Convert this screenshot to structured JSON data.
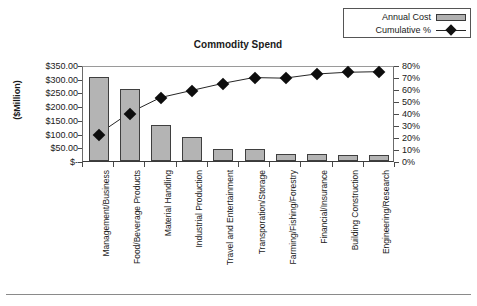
{
  "chart_data": {
    "type": "bar",
    "title": "Commodity Spend",
    "xlabel": "",
    "ylabel": "($Million)",
    "grid": false,
    "legend_position": "top-right",
    "categories": [
      "Management/Business",
      "Food/Beverage Products",
      "Material Handling",
      "Industrial Production",
      "Travel and Entertainment",
      "Transporation/Storage",
      "Farming/Fishing/Forestry",
      "Financial/Insurance",
      "Building Construction",
      "Engineering/Research"
    ],
    "series": [
      {
        "name": "Annual Cost",
        "type": "bar",
        "axis": "left",
        "values": [
          307.0,
          264.0,
          131.0,
          88.0,
          45.0,
          45.0,
          24.0,
          24.0,
          22.0,
          23.0
        ]
      },
      {
        "name": "Cumulative %",
        "type": "line",
        "axis": "right",
        "values": [
          23,
          41,
          54,
          60,
          66,
          71,
          70.5,
          74,
          75.5,
          76
        ]
      }
    ],
    "ylim": [
      0,
      350
    ],
    "yticks": [
      0,
      50,
      100,
      150,
      200,
      250,
      300,
      350
    ],
    "ytick_labels": [
      "$-",
      "$50.00",
      "$100.00",
      "$150.00",
      "$200.00",
      "$250.00",
      "$300.00",
      "$350.00"
    ],
    "y2lim": [
      0,
      80
    ],
    "y2ticks": [
      0,
      10,
      20,
      30,
      40,
      50,
      60,
      70,
      80
    ],
    "y2tick_labels": [
      "0%",
      "10%",
      "20%",
      "30%",
      "40%",
      "50%",
      "60%",
      "70%",
      "80%"
    ]
  },
  "legend": {
    "items": [
      {
        "label": "Annual Cost",
        "marker": "bar-swatch",
        "color": "#b0b0b0"
      },
      {
        "label": "Cumulative %",
        "marker": "line-diamond",
        "color": "#111111"
      }
    ]
  },
  "colors": {
    "bar_fill": "#b4b4b4",
    "bar_edge": "#3f3f3f",
    "line": "#262626",
    "marker": "#0d0d0d",
    "axis": "#4a4a4a",
    "text": "#1a1a1a"
  }
}
